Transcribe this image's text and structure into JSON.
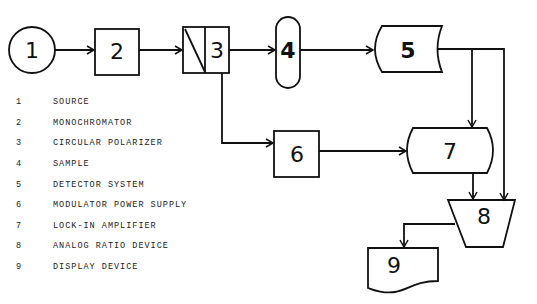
{
  "diagram": {
    "blocks": [
      {
        "id": "1",
        "label": "1",
        "shape": "circle"
      },
      {
        "id": "2",
        "label": "2",
        "shape": "rectangle"
      },
      {
        "id": "3",
        "label": "3",
        "shape": "split-rectangle"
      },
      {
        "id": "4",
        "label": "4",
        "shape": "pill"
      },
      {
        "id": "5",
        "label": "5",
        "shape": "concave-tape"
      },
      {
        "id": "6",
        "label": "6",
        "shape": "rectangle"
      },
      {
        "id": "7",
        "label": "7",
        "shape": "rounded-storage"
      },
      {
        "id": "8",
        "label": "8",
        "shape": "trapezoid"
      },
      {
        "id": "9",
        "label": "9",
        "shape": "document"
      }
    ],
    "connections": [
      {
        "from": "1",
        "to": "2"
      },
      {
        "from": "2",
        "to": "3"
      },
      {
        "from": "3",
        "to": "4"
      },
      {
        "from": "4",
        "to": "5"
      },
      {
        "from": "3",
        "to": "6"
      },
      {
        "from": "6",
        "to": "7"
      },
      {
        "from": "5",
        "to": "7"
      },
      {
        "from": "5",
        "to": "8"
      },
      {
        "from": "7",
        "to": "8"
      },
      {
        "from": "8",
        "to": "9"
      }
    ]
  },
  "legend": [
    {
      "num": "1",
      "text": "SOURCE"
    },
    {
      "num": "2",
      "text": "MONOCHROMATOR"
    },
    {
      "num": "3",
      "text": "CIRCULAR POLARIZER"
    },
    {
      "num": "4",
      "text": "SAMPLE"
    },
    {
      "num": "5",
      "text": "DETECTOR SYSTEM"
    },
    {
      "num": "6",
      "text": "MODULATOR POWER SUPPLY"
    },
    {
      "num": "7",
      "text": "LOCK-IN AMPLIFIER"
    },
    {
      "num": "8",
      "text": "ANALOG RATIO DEVICE"
    },
    {
      "num": "9",
      "text": "DISPLAY DEVICE"
    }
  ]
}
